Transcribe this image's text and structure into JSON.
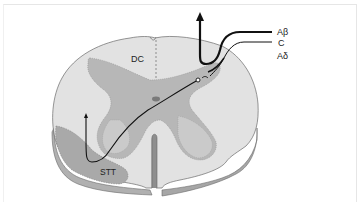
{
  "figure": {
    "type": "anatomical-diagram",
    "labels": {
      "dorsal_column": "DC",
      "spinothalamic_tract": "STT",
      "fiber_abeta": "Aβ",
      "fiber_c": "C",
      "fiber_adelta": "Aδ"
    },
    "colors": {
      "white_matter": "#e4e4e4",
      "gray_matter": "#b5b5b5",
      "stt_region": "#a8a8a8",
      "cut_edge_light": "#d2d2d2",
      "cut_edge_dark": "#9a9a9a",
      "outline": "#6a6a6a",
      "fiber": "#111111",
      "central_canal": "#7a7a7a"
    }
  }
}
